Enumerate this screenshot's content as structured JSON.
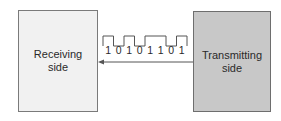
{
  "diagram": {
    "receiving": {
      "line1": "Receiving",
      "line2": "side",
      "fill": "#f1f1f1"
    },
    "transmitting": {
      "line1": "Transmitting",
      "line2": "side",
      "fill": "#c8c8c8"
    },
    "signal": {
      "bits": [
        "1",
        "0",
        "1",
        "0",
        "1",
        "1",
        "0",
        "1"
      ],
      "direction": "transmitting-to-receiving"
    },
    "arrow": {
      "color": "#555555"
    }
  }
}
